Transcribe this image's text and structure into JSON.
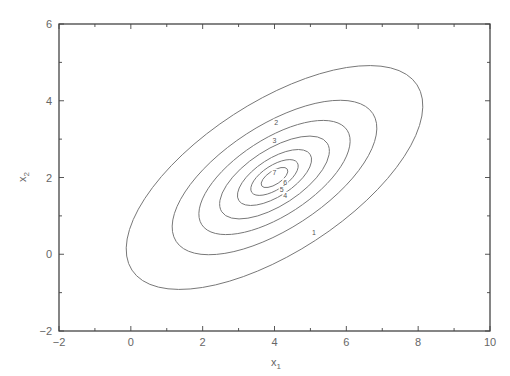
{
  "chart_data": {
    "type": "contour",
    "title": "",
    "xlabel": "x1",
    "ylabel": "x2",
    "xlim": [
      -2,
      10
    ],
    "ylim": [
      -2,
      6
    ],
    "x_ticks": [
      -2,
      0,
      2,
      4,
      6,
      8,
      10
    ],
    "y_ticks": [
      -2,
      0,
      2,
      4,
      6
    ],
    "grid": false,
    "legend": null,
    "center": {
      "x": 4,
      "y": 2
    },
    "contour_levels": [
      1,
      2,
      3,
      4,
      5,
      6,
      7
    ],
    "contour_labels": [
      {
        "level": "1",
        "x": 5.1,
        "y": 0.55
      },
      {
        "level": "2",
        "x": 4.05,
        "y": 3.4
      },
      {
        "level": "3",
        "x": 4.0,
        "y": 2.95
      },
      {
        "level": "4",
        "x": 4.3,
        "y": 1.5
      },
      {
        "level": "5",
        "x": 4.2,
        "y": 1.65
      },
      {
        "level": "6",
        "x": 4.3,
        "y": 1.85
      },
      {
        "level": "7",
        "x": 4.0,
        "y": 2.1
      }
    ],
    "contour_scales": [
      1.0,
      0.69,
      0.51,
      0.37,
      0.25,
      0.16,
      0.09
    ]
  },
  "axes": {
    "x_tick_labels": [
      "−2",
      "0",
      "2",
      "4",
      "6",
      "8",
      "10"
    ],
    "y_tick_labels": [
      "−2",
      "0",
      "2",
      "4",
      "6"
    ],
    "xlabel_main": "x",
    "xlabel_sub": "1",
    "ylabel_main": "x",
    "ylabel_sub": "2"
  }
}
